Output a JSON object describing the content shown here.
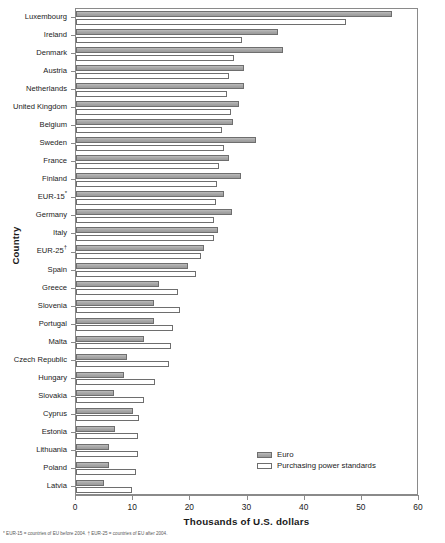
{
  "chart_data": {
    "type": "bar",
    "orientation": "horizontal",
    "title": "",
    "xlabel": "Thousands of U.S. dollars",
    "ylabel": "Country",
    "xlim": [
      0,
      60
    ],
    "xticks": [
      0,
      10,
      20,
      30,
      40,
      50,
      60
    ],
    "grid": false,
    "legend_position": "bottom-right",
    "categories": [
      "Luxembourg",
      "Ireland",
      "Denmark",
      "Austria",
      "Netherlands",
      "United Kingdom",
      "Belgium",
      "Sweden",
      "France",
      "Finland",
      "EUR-15*",
      "Germany",
      "Italy",
      "EUR-25†",
      "Spain",
      "Greece",
      "Slovenia",
      "Portugal",
      "Malta",
      "Czech Republic",
      "Hungary",
      "Slovakia",
      "Cyprus",
      "Estonia",
      "Lithuania",
      "Poland",
      "Latvia"
    ],
    "series": [
      {
        "name": "Euro",
        "color": "#a6a6a6",
        "values": [
          55.2,
          35.3,
          36.2,
          29.4,
          29.4,
          28.5,
          27.4,
          31.5,
          26.8,
          28.8,
          25.9,
          27.3,
          24.9,
          22.4,
          19.6,
          14.6,
          13.7,
          13.7,
          11.9,
          8.9,
          8.4,
          6.7,
          9.9,
          6.8,
          5.8,
          5.8,
          4.9
        ]
      },
      {
        "name": "Purchasing power standards",
        "color": "#ffffff",
        "values": [
          47.2,
          29.1,
          27.6,
          26.8,
          26.5,
          27.1,
          25.6,
          25.9,
          25.0,
          24.7,
          24.5,
          24.1,
          24.1,
          21.8,
          21.0,
          17.9,
          18.2,
          17.0,
          16.6,
          16.3,
          13.8,
          11.9,
          11.1,
          10.9,
          10.9,
          10.5,
          9.8
        ]
      }
    ]
  },
  "legend": {
    "entries": [
      {
        "label": "Euro",
        "swatch": "filled-gray"
      },
      {
        "label": "Purchasing power standards",
        "swatch": "outline-white"
      }
    ]
  },
  "footnote": "* EUR-15 = countries of EU before 2004.   † EUR-25 = countries of EU after 2004."
}
